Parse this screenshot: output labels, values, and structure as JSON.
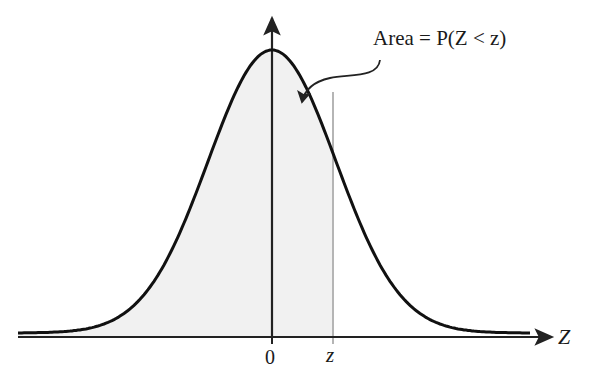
{
  "diagram": {
    "annotation": "Area = P(Z < z)",
    "x_axis_label": "Z",
    "origin_label": "0",
    "z_marker_label": "z",
    "colors": {
      "curve": "#111111",
      "axis": "#222222",
      "shaded_area": "#f1f1f1",
      "z_line": "#b5b5b5"
    }
  },
  "chart_data": {
    "type": "area",
    "title": "",
    "xlabel": "Z",
    "ylabel": "",
    "curve": "standard normal density",
    "shaded_region": "Z < z",
    "markers": [
      {
        "x": 0,
        "label": "0"
      },
      {
        "x": "z",
        "label": "z"
      }
    ],
    "annotations": [
      "Area = P(Z < z)"
    ],
    "grid": false
  }
}
